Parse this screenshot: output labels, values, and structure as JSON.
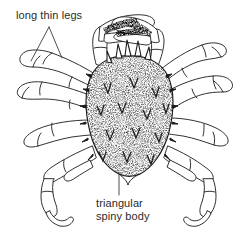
{
  "figure": {
    "style": "pen-and-ink line drawing",
    "background_color": "#ffffff",
    "ink_color": "#1a1a1a",
    "text_color": "#2b2b2b",
    "width": 251,
    "height": 236
  },
  "labels": {
    "legs": {
      "text": "long thin legs",
      "leader": "forked-v"
    },
    "body": {
      "line1": "triangular",
      "line2": "spiny body",
      "leader": "vertical"
    }
  }
}
